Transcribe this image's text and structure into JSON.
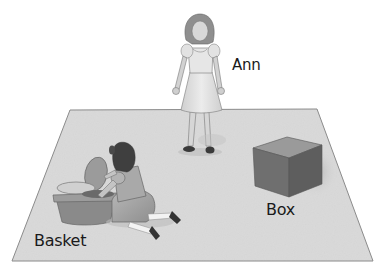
{
  "scene": {
    "description": "Illustration of a floor mat with a standing girl, a kneeling girl at a basket, and a box",
    "labels": {
      "ann": "Ann",
      "box": "Box",
      "basket": "Basket"
    },
    "figures": [
      {
        "name": "Ann",
        "pose": "standing",
        "position": "center-top, behind the mat"
      },
      {
        "name": "kneeling girl",
        "pose": "kneeling beside basket",
        "position": "left of mat"
      }
    ],
    "objects": [
      {
        "name": "Basket",
        "position": "lower-left of mat"
      },
      {
        "name": "Box",
        "position": "right side of mat"
      }
    ],
    "colors": {
      "background": "#ffffff",
      "floor": "#d9d9d9",
      "floor_edge": "#8a8a8a",
      "box_front": "#6f6f6f",
      "box_side": "#5e5e5e",
      "box_top": "#9a9a9a",
      "text": "#1a1a1a"
    }
  }
}
